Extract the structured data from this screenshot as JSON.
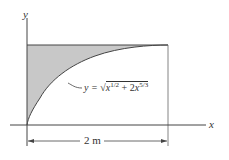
{
  "diagram": {
    "axes": {
      "x_label": "x",
      "y_label": "y"
    },
    "curve": {
      "equation_prefix": "y = ",
      "radical": "√",
      "term1_base": "x",
      "term1_exp": "1/2",
      "plus": " + 2",
      "term2_base": "x",
      "term2_exp": "5/3"
    },
    "dimension": {
      "label": "2 m",
      "value": 2,
      "unit": "m"
    },
    "shaded_region": "area between curve, y-axis, and top line",
    "colors": {
      "shade": "#c8c8c8",
      "line": "#444444"
    }
  }
}
